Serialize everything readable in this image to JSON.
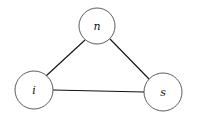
{
  "diagram": {
    "type": "undirected-graph",
    "nodes": [
      {
        "id": "n",
        "label": "n",
        "cx": 97,
        "cy": 26,
        "r": 18
      },
      {
        "id": "i",
        "label": "i",
        "cx": 34,
        "cy": 90,
        "r": 19
      },
      {
        "id": "s",
        "label": "s",
        "cx": 163,
        "cy": 92,
        "r": 19
      }
    ],
    "edges": [
      {
        "from": "n",
        "to": "i"
      },
      {
        "from": "n",
        "to": "s"
      },
      {
        "from": "i",
        "to": "s"
      }
    ],
    "colors": {
      "stroke": "#333333",
      "background": "#ffffff"
    }
  }
}
